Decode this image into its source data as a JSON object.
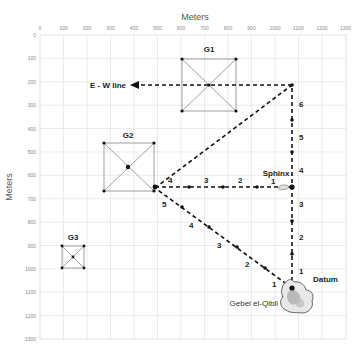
{
  "x_axis": {
    "title": "Meters",
    "ticks": [
      "0",
      "100",
      "200",
      "300",
      "400",
      "500",
      "600",
      "700",
      "800",
      "900",
      "1000",
      "1100",
      "1200",
      "1300"
    ]
  },
  "y_axis": {
    "title": "Meters",
    "ticks": [
      "0",
      "100",
      "200",
      "300",
      "400",
      "500",
      "600",
      "700",
      "800",
      "900",
      "1000",
      "1100",
      "1200",
      "1300"
    ]
  },
  "pyramids": [
    {
      "label": "G1"
    },
    {
      "label": "G2"
    },
    {
      "label": "G3"
    }
  ],
  "labels": {
    "ew_line": "E - W line",
    "sphinx": "Sphinx",
    "datum": "Datum",
    "gebel": "Gebel el-Qibli"
  },
  "north_line_steps": [
    "1",
    "2",
    "3",
    "4",
    "5",
    "6"
  ],
  "west_line_steps": [
    "1",
    "2",
    "3",
    "4"
  ],
  "diagonal_steps": [
    "1",
    "2",
    "3",
    "4",
    "5"
  ],
  "colors": {
    "grid": "#dedede",
    "line": "#111111",
    "square": "#888888"
  }
}
